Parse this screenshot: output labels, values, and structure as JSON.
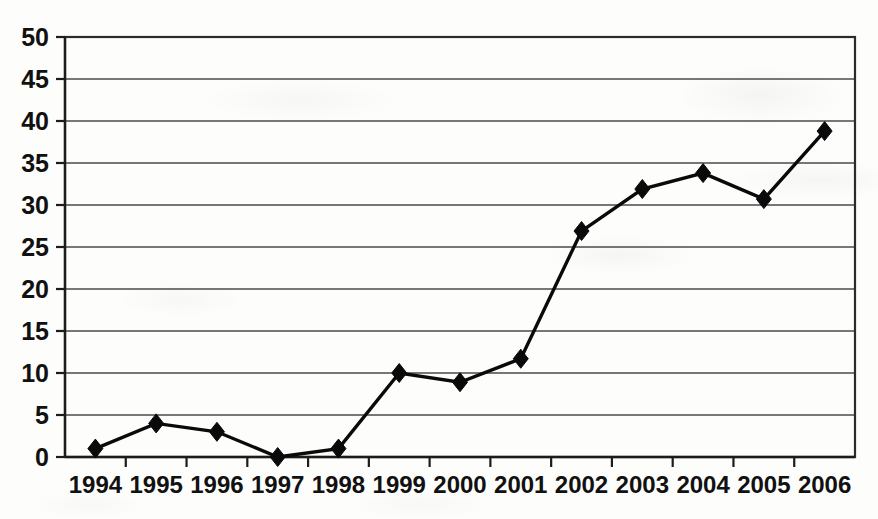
{
  "chart_data": {
    "type": "line",
    "title": "",
    "subtitle": "",
    "xlabel": "",
    "ylabel": "",
    "categories": [
      "1994",
      "1995",
      "1996",
      "1997",
      "1998",
      "1999",
      "2000",
      "2001",
      "2002",
      "2003",
      "2004",
      "2005",
      "2006"
    ],
    "values": [
      1.0,
      4.0,
      3.0,
      0.0,
      1.0,
      10.0,
      8.9,
      11.7,
      26.9,
      31.9,
      33.8,
      30.7,
      38.8
    ],
    "series": [
      {
        "name": "",
        "values": [
          1.0,
          4.0,
          3.0,
          0.0,
          1.0,
          10.0,
          8.9,
          11.7,
          26.9,
          31.9,
          33.8,
          30.7,
          38.8
        ]
      }
    ],
    "ylim": [
      0,
      50
    ],
    "ytick_labels": [
      "0",
      "5",
      "10",
      "15",
      "20",
      "25",
      "30",
      "35",
      "40",
      "45",
      "50"
    ],
    "ytick_values": [
      0,
      5,
      10,
      15,
      20,
      25,
      30,
      35,
      40,
      45,
      50
    ],
    "xtick_labels": [
      "1994",
      "1995",
      "1996",
      "1997",
      "1998",
      "1999",
      "2000",
      "2001",
      "2002",
      "2003",
      "2004",
      "2005",
      "2006"
    ],
    "grid": true,
    "grid_axis": "y",
    "legend": false,
    "legend_position": "none",
    "marker": "diamond",
    "line_color": "#0a0a0a",
    "marker_color": "#0a0a0a",
    "grid_color": "#4a4a4a",
    "background_color": "#fdfdfb",
    "annotations": []
  },
  "figure": {
    "plot_left": 65,
    "plot_right": 855,
    "plot_top": 37,
    "plot_bottom": 457
  }
}
